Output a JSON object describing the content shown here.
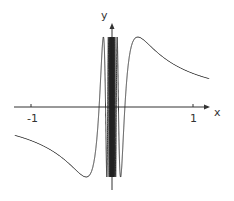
{
  "chart_data": {
    "type": "line",
    "title": "",
    "function": "y = sin(1/(2x)) (oscillating, dense near x = 0)",
    "xlabel": "x",
    "ylabel": "y",
    "x_ticks": [
      -1,
      1
    ],
    "xlim": [
      -1.2,
      1.2
    ],
    "ylim": [
      -1.1,
      1.1
    ],
    "grid": false,
    "legend": "none",
    "series": [
      {
        "name": "curve",
        "color": "#222222"
      }
    ]
  },
  "axes": {
    "x_label": "x",
    "y_label": "y",
    "tick_neg": "-1",
    "tick_pos": "1"
  }
}
